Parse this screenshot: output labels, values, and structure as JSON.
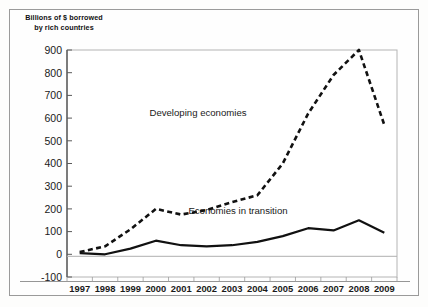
{
  "chart_data": {
    "type": "line",
    "title": "Billions of $ borrowed by rich countries",
    "xlabel": "",
    "ylabel": "",
    "ylim": [
      -100,
      900
    ],
    "ytick_step": 100,
    "grid": false,
    "legend_position": "inline-annotations",
    "categories": [
      "1997",
      "1998",
      "1999",
      "2000",
      "2001",
      "2002",
      "2003",
      "2004",
      "2005",
      "2006",
      "2007",
      "2008",
      "2009"
    ],
    "yticks": [
      "900",
      "800",
      "700",
      "600",
      "500",
      "400",
      "300",
      "200",
      "100",
      "0",
      "-100"
    ],
    "series": [
      {
        "name": "Developing economies",
        "style": "dashed",
        "color": "#111111",
        "values": [
          10,
          35,
          110,
          200,
          175,
          195,
          230,
          260,
          400,
          620,
          790,
          900,
          570
        ]
      },
      {
        "name": "Economies in transition",
        "style": "solid",
        "color": "#111111",
        "values": [
          5,
          0,
          25,
          60,
          40,
          35,
          40,
          55,
          80,
          115,
          105,
          150,
          95
        ]
      }
    ],
    "annotations": [
      {
        "text": "Developing economies",
        "x": 198,
        "y": 116
      },
      {
        "text": "Economies in transition",
        "x": 238,
        "y": 214
      }
    ]
  }
}
